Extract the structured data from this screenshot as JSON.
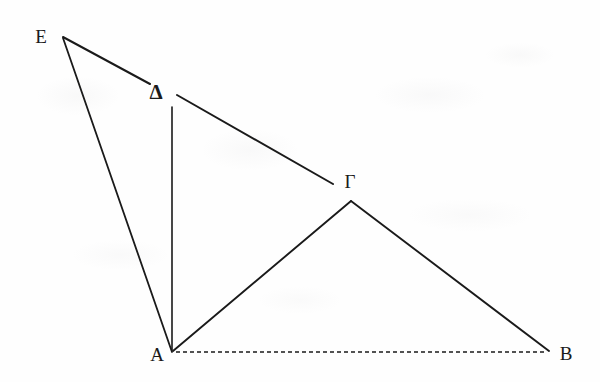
{
  "figure": {
    "background_color": "#fefefe",
    "stroke_color": "#1a1a1a",
    "canvas": {
      "width": 600,
      "height": 382
    }
  },
  "labels": {
    "e": "E",
    "delta": "Δ",
    "gamma": "Γ",
    "a": "A",
    "b": "B"
  },
  "label_positions": {
    "e": {
      "x": 41,
      "y": 36
    },
    "delta": {
      "x": 156,
      "y": 92
    },
    "gamma": {
      "x": 350,
      "y": 181
    },
    "a": {
      "x": 157,
      "y": 354
    },
    "b": {
      "x": 566,
      "y": 353
    }
  },
  "vertices": {
    "E": {
      "x": 63,
      "y": 37
    },
    "Delta": {
      "x": 166,
      "y": 90
    },
    "Gamma": {
      "x": 351,
      "y": 201
    },
    "A": {
      "x": 172,
      "y": 352
    },
    "B": {
      "x": 549,
      "y": 352
    }
  },
  "segments": [
    {
      "name": "E-to-Delta",
      "from": "E",
      "to": "Delta",
      "style": "solid",
      "x1": 63,
      "y1": 37,
      "x2": 150,
      "y2": 84,
      "width": 2.0
    },
    {
      "name": "E-to-A",
      "from": "E",
      "to": "A",
      "style": "solid",
      "x1": 63,
      "y1": 38,
      "x2": 172,
      "y2": 352,
      "width": 1.8
    },
    {
      "name": "Delta-to-Gamma",
      "from": "Delta",
      "to": "Gamma",
      "style": "solid",
      "x1": 177,
      "y1": 95,
      "x2": 333,
      "y2": 184,
      "width": 2.0
    },
    {
      "name": "Delta-to-A",
      "from": "Delta",
      "to": "A",
      "style": "solid",
      "x1": 172,
      "y1": 107,
      "x2": 172,
      "y2": 350,
      "width": 1.6
    },
    {
      "name": "A-to-Gamma",
      "from": "A",
      "to": "Gamma",
      "style": "solid",
      "x1": 173,
      "y1": 351,
      "x2": 351,
      "y2": 201,
      "width": 1.9
    },
    {
      "name": "Gamma-to-B",
      "from": "Gamma",
      "to": "B",
      "style": "solid",
      "x1": 351,
      "y1": 201,
      "x2": 549,
      "y2": 351,
      "width": 1.9
    },
    {
      "name": "A-to-B-baseline",
      "from": "A",
      "to": "B",
      "style": "dashed",
      "x1": 176,
      "y1": 352,
      "x2": 547,
      "y2": 352,
      "width": 1.7,
      "dash": "4 3"
    }
  ]
}
